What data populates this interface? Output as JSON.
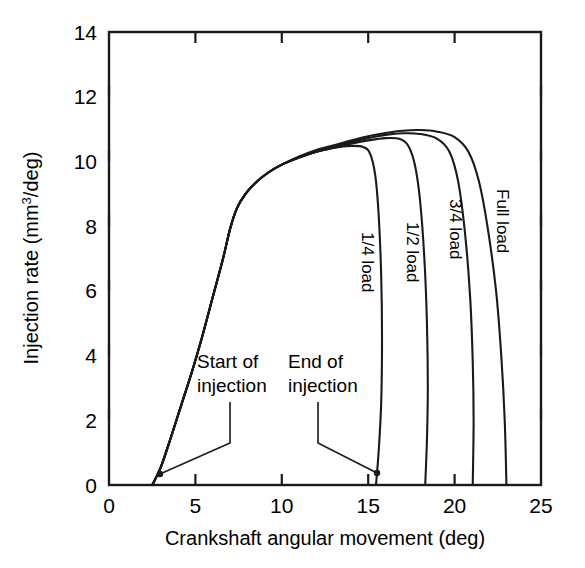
{
  "chart_data": {
    "type": "line",
    "title": "",
    "xlabel": "Crankshaft angular movement (deg)",
    "ylabel_prefix": "Injection rate (mm",
    "ylabel_super": "3",
    "ylabel_suffix": "/deg)",
    "ylabel_full": "Injection rate (mm3/deg)",
    "xlim": [
      0,
      25
    ],
    "ylim": [
      0,
      14
    ],
    "xticks": [
      0,
      5,
      10,
      15,
      20,
      25
    ],
    "xtick_labels": [
      "0",
      "5",
      "10",
      "15",
      "20",
      "25"
    ],
    "yticks": [
      0,
      2,
      4,
      6,
      8,
      10,
      12,
      14
    ],
    "ytick_labels": [
      "0",
      "2",
      "4",
      "6",
      "8",
      "10",
      "12",
      "14"
    ],
    "grid": false,
    "legend_position": "inline-curve-labels",
    "frame": "box",
    "tick_direction": "in",
    "series": [
      {
        "name": "1/4 load",
        "label": "1/4 load",
        "label_rotation": 90,
        "points": [
          [
            2.5,
            0.0
          ],
          [
            3.0,
            0.55
          ],
          [
            3.6,
            1.5
          ],
          [
            4.2,
            2.5
          ],
          [
            4.8,
            3.5
          ],
          [
            5.4,
            4.6
          ],
          [
            6.0,
            5.8
          ],
          [
            6.6,
            7.0
          ],
          [
            7.0,
            7.9
          ],
          [
            7.4,
            8.55
          ],
          [
            7.9,
            9.0
          ],
          [
            8.5,
            9.35
          ],
          [
            9.2,
            9.65
          ],
          [
            10.0,
            9.9
          ],
          [
            11.0,
            10.12
          ],
          [
            12.0,
            10.3
          ],
          [
            13.0,
            10.42
          ],
          [
            14.0,
            10.48
          ],
          [
            14.7,
            10.45
          ],
          [
            15.1,
            10.25
          ],
          [
            15.4,
            9.6
          ],
          [
            15.6,
            8.4
          ],
          [
            15.75,
            6.5
          ],
          [
            15.8,
            4.5
          ],
          [
            15.75,
            2.5
          ],
          [
            15.6,
            1.0
          ],
          [
            15.45,
            0.0
          ]
        ]
      },
      {
        "name": "1/2 load",
        "label": "1/2 load",
        "label_rotation": 90,
        "points": [
          [
            2.5,
            0.0
          ],
          [
            3.0,
            0.55
          ],
          [
            3.6,
            1.5
          ],
          [
            4.2,
            2.5
          ],
          [
            4.8,
            3.5
          ],
          [
            5.4,
            4.6
          ],
          [
            6.0,
            5.8
          ],
          [
            6.6,
            7.0
          ],
          [
            7.0,
            7.9
          ],
          [
            7.4,
            8.55
          ],
          [
            7.9,
            9.0
          ],
          [
            8.5,
            9.35
          ],
          [
            9.2,
            9.65
          ],
          [
            10.0,
            9.9
          ],
          [
            11.0,
            10.12
          ],
          [
            12.0,
            10.3
          ],
          [
            13.0,
            10.42
          ],
          [
            14.0,
            10.55
          ],
          [
            15.0,
            10.65
          ],
          [
            16.0,
            10.72
          ],
          [
            16.8,
            10.7
          ],
          [
            17.3,
            10.5
          ],
          [
            17.7,
            9.9
          ],
          [
            18.0,
            8.8
          ],
          [
            18.25,
            7.0
          ],
          [
            18.4,
            5.0
          ],
          [
            18.45,
            3.0
          ],
          [
            18.4,
            1.4
          ],
          [
            18.3,
            0.0
          ]
        ]
      },
      {
        "name": "3/4 load",
        "label": "3/4 load",
        "label_rotation": 90,
        "points": [
          [
            2.5,
            0.0
          ],
          [
            3.0,
            0.55
          ],
          [
            3.6,
            1.5
          ],
          [
            4.2,
            2.5
          ],
          [
            4.8,
            3.5
          ],
          [
            5.4,
            4.6
          ],
          [
            6.0,
            5.8
          ],
          [
            6.6,
            7.0
          ],
          [
            7.0,
            7.9
          ],
          [
            7.4,
            8.55
          ],
          [
            7.9,
            9.0
          ],
          [
            8.5,
            9.35
          ],
          [
            9.2,
            9.65
          ],
          [
            10.0,
            9.9
          ],
          [
            11.0,
            10.12
          ],
          [
            12.0,
            10.3
          ],
          [
            13.0,
            10.45
          ],
          [
            14.0,
            10.6
          ],
          [
            15.0,
            10.72
          ],
          [
            16.0,
            10.82
          ],
          [
            17.0,
            10.87
          ],
          [
            18.0,
            10.85
          ],
          [
            19.0,
            10.7
          ],
          [
            19.7,
            10.3
          ],
          [
            20.2,
            9.4
          ],
          [
            20.6,
            7.8
          ],
          [
            20.9,
            5.8
          ],
          [
            21.05,
            3.8
          ],
          [
            21.1,
            2.0
          ],
          [
            21.05,
            0.0
          ]
        ]
      },
      {
        "name": "Full load",
        "label": "Full load",
        "label_rotation": 90,
        "points": [
          [
            2.5,
            0.0
          ],
          [
            3.0,
            0.55
          ],
          [
            3.6,
            1.5
          ],
          [
            4.2,
            2.5
          ],
          [
            4.8,
            3.5
          ],
          [
            5.4,
            4.6
          ],
          [
            6.0,
            5.8
          ],
          [
            6.6,
            7.0
          ],
          [
            7.0,
            7.9
          ],
          [
            7.4,
            8.55
          ],
          [
            7.9,
            9.0
          ],
          [
            8.5,
            9.35
          ],
          [
            9.2,
            9.65
          ],
          [
            10.0,
            9.9
          ],
          [
            11.0,
            10.15
          ],
          [
            12.0,
            10.35
          ],
          [
            13.0,
            10.5
          ],
          [
            14.0,
            10.65
          ],
          [
            15.0,
            10.78
          ],
          [
            16.0,
            10.88
          ],
          [
            17.0,
            10.95
          ],
          [
            18.0,
            10.97
          ],
          [
            19.0,
            10.92
          ],
          [
            20.0,
            10.75
          ],
          [
            20.8,
            10.3
          ],
          [
            21.4,
            9.4
          ],
          [
            21.9,
            8.0
          ],
          [
            22.4,
            6.0
          ],
          [
            22.7,
            4.0
          ],
          [
            22.9,
            2.0
          ],
          [
            23.0,
            0.0
          ]
        ]
      }
    ],
    "annotations": [
      {
        "name": "start-of-injection",
        "text_line1": "Start of",
        "text_line2": "injection",
        "target_point": [
          3.0,
          0.3
        ],
        "marker": "dot"
      },
      {
        "name": "end-of-injection",
        "text_line1": "End of",
        "text_line2": "injection",
        "target_point": [
          15.5,
          0.35
        ],
        "marker": "dot"
      }
    ],
    "colors": {
      "line": "#1a1a1a",
      "axis": "#1a1a1a",
      "background": "#ffffff",
      "text": "#000000"
    }
  },
  "caption": {
    "partial_text": ""
  }
}
